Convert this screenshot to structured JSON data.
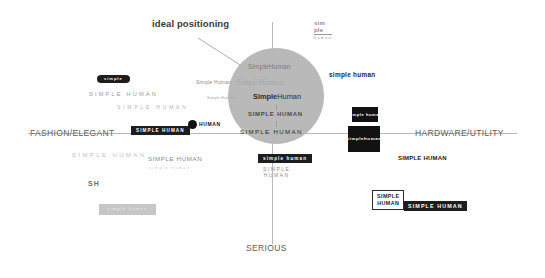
{
  "diagram": {
    "callout_label": "ideal positioning",
    "axes": {
      "left_label": "FASHION/ELEGANT",
      "right_label": "HARDWARE/UTILITY",
      "bottom_label": "SERIOUS",
      "top_label": ""
    },
    "ideal_zone": {
      "shape": "circle",
      "fill": "#b9b9b9",
      "center_x": 276,
      "center_y": 96,
      "radius": 48,
      "variants": [
        {
          "text": "SimpleHuman",
          "style": "regular"
        },
        {
          "text": "SimpleHuman",
          "style": "italic-serif-light"
        },
        {
          "text_bold": "Simple",
          "text_regular": "Human",
          "style": "mixed-weight"
        },
        {
          "text": "SIMPLE HUMAN",
          "style": "bold-caps"
        },
        {
          "text": "SIMPLE HUMAN",
          "style": "spaced-caps"
        }
      ]
    },
    "marks": [
      {
        "name": "pill-logo",
        "text": "simple",
        "type": "pill-dark"
      },
      {
        "name": "spaced-caps-1",
        "text": "SIMPLE HUMAN",
        "type": "spaced-caps"
      },
      {
        "name": "spaced-caps-2",
        "text": "SIMPLE HUMAN",
        "type": "spaced-caps-light"
      },
      {
        "name": "dark-bar-left",
        "text": "SIMPLE HUMAN",
        "type": "chip-dark"
      },
      {
        "name": "dot-logo",
        "text": "HUMAN",
        "type": "dot-mark"
      },
      {
        "name": "small-serif-1",
        "text": "Simple Human",
        "type": "serif-small"
      },
      {
        "name": "small-serif-2",
        "text": "Simple Human",
        "type": "serif-tiny"
      },
      {
        "name": "bold-right",
        "text": "simple human",
        "type": "bold-lower"
      },
      {
        "name": "stack-logo",
        "line1": "sim",
        "line2": "ple",
        "line3": "human",
        "type": "stacked"
      },
      {
        "name": "spaced-caps-3",
        "text": "SIMPLE HUMAN",
        "type": "spaced-caps-pale"
      },
      {
        "name": "sh-monogram",
        "text": "SH",
        "type": "monogram"
      },
      {
        "name": "gray-chip-left",
        "text": "simple human",
        "type": "chip-gray"
      },
      {
        "name": "mid-caps",
        "text": "SIMPLE  HUMAN",
        "type": "caps-gray"
      },
      {
        "name": "mid-caps-sub",
        "text": "simple human",
        "type": "tiny-sub"
      },
      {
        "name": "bottom-chip",
        "text": "simple human",
        "type": "chip-dark"
      },
      {
        "name": "bottom-stack",
        "line1": "SIMPLE",
        "line2": "HUMAN",
        "type": "stacked-caps"
      },
      {
        "name": "box-small-right",
        "text": "simple human",
        "type": "box-dark-small"
      },
      {
        "name": "box-right",
        "line1": "simple",
        "line2": "human",
        "type": "box-dark"
      },
      {
        "name": "bold-hardware",
        "text": "SIMPLE HUMAN",
        "type": "bold-caps-dark"
      },
      {
        "name": "outline-box",
        "line1": "SIMPLE",
        "line2": "HUMAN",
        "type": "chip-outline"
      },
      {
        "name": "inverse-bar",
        "text": "SIMPLE HUMAN",
        "type": "chip-dark-wide"
      }
    ]
  }
}
